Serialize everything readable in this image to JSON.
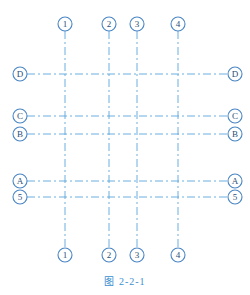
{
  "caption": "图   2-2-1",
  "colors": {
    "line": "#5aa6dc",
    "circle": "#4a86c4",
    "text": "#2a4f7a",
    "caption": "#3b8fd0"
  },
  "columns": [
    {
      "label": "1",
      "x": 65
    },
    {
      "label": "2",
      "x": 109
    },
    {
      "label": "3",
      "x": 137
    },
    {
      "label": "4",
      "x": 178
    }
  ],
  "rows": [
    {
      "label": "D",
      "y": 74
    },
    {
      "label": "C",
      "y": 116
    },
    {
      "label": "B",
      "y": 134
    },
    {
      "label": "A",
      "y": 181
    },
    {
      "label": "5",
      "y": 197
    }
  ],
  "column_top_y": 24,
  "column_bottom_y": 255,
  "row_left_x": 20,
  "row_right_x": 235
}
